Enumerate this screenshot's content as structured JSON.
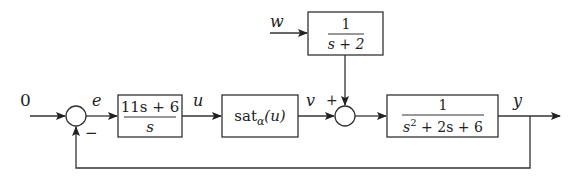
{
  "diagram": {
    "type": "feedback-block-diagram",
    "reference_input": "0",
    "signals": {
      "error": "e",
      "control": "u",
      "saturated": "v",
      "disturbance": "w",
      "output": "y"
    },
    "summing_junctions": [
      {
        "id": "sum1",
        "signs": {
          "feedback": "−"
        }
      },
      {
        "id": "sum2",
        "signs": {
          "v_input": "+"
        }
      }
    ],
    "blocks": {
      "controller": {
        "numerator": "11s + 6",
        "denominator": "s"
      },
      "saturation": {
        "label": "sat",
        "subscript": "α",
        "argument": "(u)"
      },
      "disturbance_filter": {
        "numerator": "1",
        "denominator": "s + 2"
      },
      "plant": {
        "numerator": "1",
        "denominator_main": "s",
        "denominator_exp": "2",
        "denominator_rest": " + 2s + 6"
      }
    }
  }
}
